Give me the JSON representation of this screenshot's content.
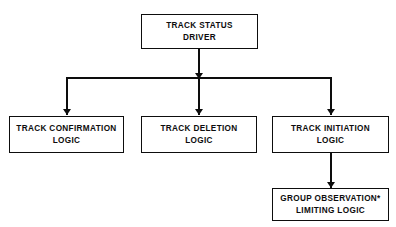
{
  "diagram": {
    "background_color": "#ffffff",
    "line_color": "#0d0d0d",
    "nodes": [
      {
        "id": "track-status-driver",
        "line1": "TRACK STATUS",
        "line2": "DRIVER"
      },
      {
        "id": "track-confirmation-logic",
        "line1": "TRACK CONFIRMATION",
        "line2": "LOGIC"
      },
      {
        "id": "track-deletion-logic",
        "line1": "TRACK DELETION",
        "line2": "LOGIC"
      },
      {
        "id": "track-initiation-logic",
        "line1": "TRACK INITIATION",
        "line2": "LOGIC"
      },
      {
        "id": "group-observation-limiting-logic",
        "line1": "GROUP OBSERVATION*",
        "line2": "LIMITING LOGIC"
      }
    ],
    "edges": [
      {
        "id": "driver-to-bus",
        "from": "track-status-driver",
        "to": "distribution-bus",
        "arrow": true
      },
      {
        "id": "bus-to-confirmation",
        "from": "distribution-bus",
        "to": "track-confirmation-logic",
        "arrow": true
      },
      {
        "id": "bus-to-deletion",
        "from": "distribution-bus",
        "to": "track-deletion-logic",
        "arrow": true
      },
      {
        "id": "bus-to-initiation",
        "from": "distribution-bus",
        "to": "track-initiation-logic",
        "arrow": true
      },
      {
        "id": "initiation-to-group",
        "from": "track-initiation-logic",
        "to": "group-observation-limiting-logic",
        "arrow": true
      }
    ]
  }
}
